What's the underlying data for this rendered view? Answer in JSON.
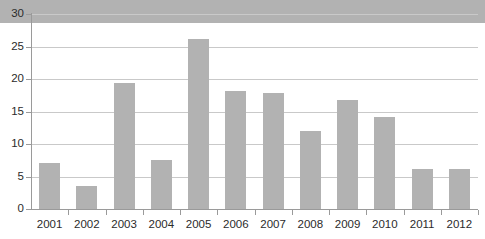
{
  "chart_data": {
    "type": "bar",
    "title": "",
    "subtitle": "",
    "xlabel": "",
    "ylabel": "",
    "categories": [
      "2001",
      "2002",
      "2003",
      "2004",
      "2005",
      "2006",
      "2007",
      "2008",
      "2009",
      "2010",
      "2011",
      "2012"
    ],
    "values": [
      3.5,
      7.1,
      3.6,
      19.4,
      7.5,
      26.1,
      18.1,
      17.9,
      12.0,
      16.8,
      14.2,
      6.2
    ],
    "ylim": [
      0,
      30
    ],
    "xlim_categories": 12,
    "y_ticks": [
      0,
      5,
      10,
      15,
      20,
      25,
      30
    ],
    "y_tick_labels": [
      "0",
      "5",
      "10",
      "15",
      "20",
      "25",
      "30"
    ],
    "grid": "horizontal",
    "legend": "none",
    "legend_entries": [],
    "annotations": [],
    "bar_color": "#b2b2b2",
    "gridline_color": "#c9c9c9",
    "axis_color": "#9a9a9a",
    "background_color": "#ffffff",
    "text_color": "#2b2b2b"
  }
}
